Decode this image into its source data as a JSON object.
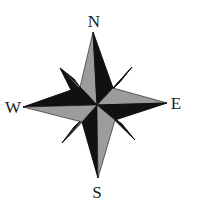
{
  "figure": {
    "type": "compass-rose",
    "labels": {
      "north": "N",
      "east": "E",
      "south": "S",
      "west": "W"
    },
    "colors": {
      "dark": "#111111",
      "light": "#9c9c9c",
      "background": "#ffffff"
    }
  }
}
